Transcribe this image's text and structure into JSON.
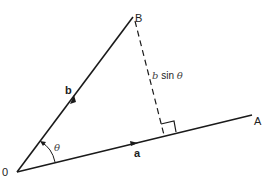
{
  "diagram": {
    "type": "vector-projection",
    "points": {
      "origin": {
        "label": "0",
        "x": 17,
        "y": 172
      },
      "B": {
        "label": "B",
        "x": 133,
        "y": 17
      },
      "A": {
        "label": "A",
        "x": 252,
        "y": 115
      }
    },
    "vectors": [
      {
        "name": "a",
        "label": "a",
        "from": "origin",
        "to": "A"
      },
      {
        "name": "b",
        "label": "b",
        "from": "origin",
        "to": "B"
      }
    ],
    "angle": {
      "label": "θ",
      "between": [
        "a",
        "b"
      ]
    },
    "perpendicular": {
      "label": "b sin θ",
      "style": "dashed"
    },
    "colors": {
      "line": "#1a1a1a",
      "text": "#222222"
    }
  },
  "labels": {
    "origin": "0",
    "B": "B",
    "A": "A",
    "vec_a": "a",
    "vec_b": "b",
    "theta": "θ",
    "b_label": "b",
    "sin_label": " sin ",
    "sin_theta": "θ"
  }
}
